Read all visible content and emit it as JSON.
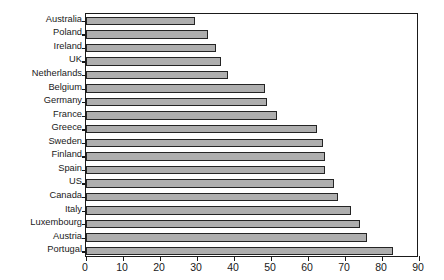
{
  "chart_data": {
    "type": "bar",
    "orientation": "horizontal",
    "title": "",
    "subtitle": "",
    "xlabel": "",
    "ylabel": "",
    "xlim": [
      0,
      90
    ],
    "ylim": null,
    "grid": false,
    "legend": null,
    "xticks": [
      0,
      10,
      20,
      30,
      40,
      50,
      60,
      70,
      80,
      90
    ],
    "xtick_labels": [
      "0",
      "10",
      "20",
      "30",
      "40",
      "50",
      "60",
      "70",
      "80",
      "90"
    ],
    "categories": [
      "Australia",
      "Poland",
      "Ireland",
      "UK",
      "Netherlands",
      "Belgium",
      "Germany",
      "France",
      "Greece",
      "Sweden",
      "Finland",
      "Spain",
      "US",
      "Canada",
      "Italy",
      "Luxembourg",
      "Austria",
      "Portugal"
    ],
    "values": [
      29.5,
      33,
      35,
      36.5,
      38.5,
      48.5,
      49,
      51.5,
      62.5,
      64,
      64.5,
      64.5,
      67,
      68,
      71.5,
      74,
      76,
      83
    ],
    "bar_fill_color": "#aeaeae",
    "bar_edge_color": "#242424",
    "axis_color": "#1a1a1a",
    "background_color": "#ffffff"
  }
}
